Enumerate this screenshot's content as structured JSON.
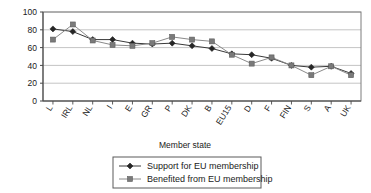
{
  "chart_data": {
    "type": "line",
    "title": "",
    "xlabel": "Member state",
    "ylabel": "",
    "ylim": [
      0,
      100
    ],
    "ytick_step": 20,
    "yticks": [
      "0",
      "20",
      "40",
      "60",
      "80",
      "100"
    ],
    "grid": true,
    "grid_axis": "y",
    "legend_position": "bottom",
    "categories": [
      "L",
      "IRL",
      "NL",
      "I",
      "E",
      "GR",
      "P",
      "DK",
      "B",
      "EU15",
      "D",
      "F",
      "FIN",
      "S",
      "A",
      "UK"
    ],
    "series": [
      {
        "name": "Support for EU membership",
        "marker": "diamond",
        "color": "#262626",
        "values": [
          81,
          78,
          69,
          69,
          65,
          64,
          65,
          62,
          59,
          53,
          52,
          48,
          40,
          38,
          39,
          31
        ]
      },
      {
        "name": "Benefited from EU membership",
        "marker": "square",
        "color": "#7a7a7a",
        "values": [
          69,
          86,
          68,
          63,
          62,
          65,
          72,
          69,
          67,
          52,
          42,
          49,
          40,
          29,
          39,
          29
        ]
      }
    ]
  },
  "legend": {
    "items": [
      {
        "label": "Support for EU membership",
        "marker": "diamond-marker"
      },
      {
        "label": "Benefited from EU membership",
        "marker": "square-marker"
      }
    ]
  },
  "axis": {
    "x_title": "Member state"
  },
  "colors": {
    "series1": "#262626",
    "series2": "#7a7a7a",
    "grid": "#b5b5b5",
    "frame": "#7d7d7d",
    "text": "#1a1a1a",
    "background": "#ffffff"
  }
}
